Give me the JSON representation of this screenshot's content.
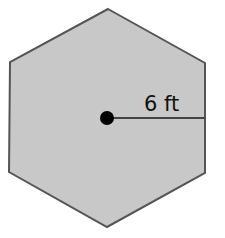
{
  "diagram": {
    "shape": "regular hexagon",
    "fill_color": "#c8c8c8",
    "stroke_color": "#555555",
    "center_dot_color": "#000000",
    "radius_label": "6 ft"
  }
}
